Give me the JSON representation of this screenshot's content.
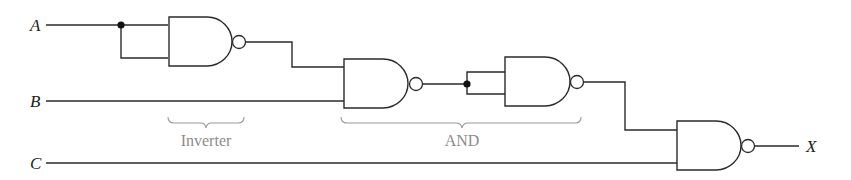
{
  "diagram": {
    "type": "logic-circuit",
    "inputs": [
      {
        "id": "A",
        "label": "A",
        "y": 25
      },
      {
        "id": "B",
        "label": "B",
        "y": 101
      },
      {
        "id": "C",
        "label": "C",
        "y": 163
      }
    ],
    "output": {
      "id": "X",
      "label": "X",
      "y": 146
    },
    "gates": [
      {
        "id": "g1",
        "type": "NAND",
        "role": "inverter",
        "inputs": [
          "A",
          "A"
        ]
      },
      {
        "id": "g2",
        "type": "NAND",
        "inputs": [
          "g1",
          "B"
        ]
      },
      {
        "id": "g3",
        "type": "NAND",
        "role": "inverter",
        "inputs": [
          "g2",
          "g2"
        ]
      },
      {
        "id": "g4",
        "type": "NAND",
        "inputs": [
          "g3",
          "C"
        ],
        "output": "X"
      }
    ],
    "groups": [
      {
        "label": "Inverter",
        "gates": [
          "g1"
        ]
      },
      {
        "label": "AND",
        "gates": [
          "g2",
          "g3"
        ]
      }
    ],
    "colors": {
      "wire": "#2a2a2a",
      "brace": "#9a9a9a",
      "group_label": "#8c8c8c"
    }
  }
}
